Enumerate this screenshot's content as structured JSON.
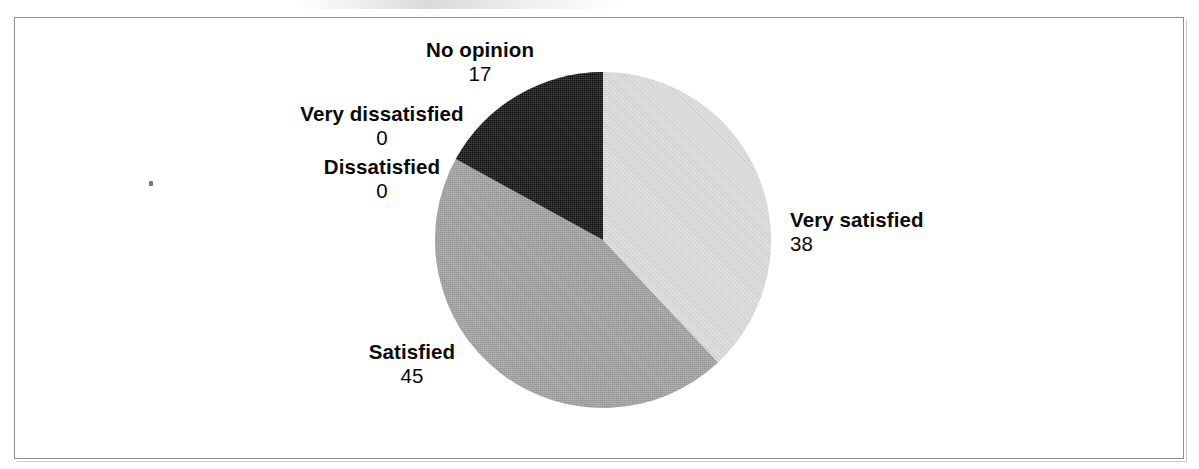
{
  "chart_data": {
    "type": "pie",
    "title": "",
    "categories": [
      "Very satisfied",
      "Satisfied",
      "No opinion",
      "Dissatisfied",
      "Very dissatisfied"
    ],
    "values": [
      38,
      45,
      17,
      0,
      0
    ],
    "total": 100,
    "start_angle_deg": 0,
    "direction": "clockwise",
    "legend": "none",
    "grid": false,
    "slices": [
      {
        "label": "Very satisfied",
        "value": 38,
        "percent": 38,
        "color": "#d8d8d8",
        "start_deg": 0,
        "end_deg": 136.8
      },
      {
        "label": "Satisfied",
        "value": 45,
        "percent": 45,
        "color": "#9a9a9a",
        "start_deg": 136.8,
        "end_deg": 298.8
      },
      {
        "label": "No opinion",
        "value": 17,
        "percent": 17,
        "color": "#0a0a0a",
        "start_deg": 298.8,
        "end_deg": 360
      },
      {
        "label": "Dissatisfied",
        "value": 0,
        "percent": 0,
        "color": "#ffffff",
        "start_deg": 360,
        "end_deg": 360
      },
      {
        "label": "Very dissatisfied",
        "value": 0,
        "percent": 0,
        "color": "#ffffff",
        "start_deg": 360,
        "end_deg": 360
      }
    ]
  },
  "labels": {
    "no_opinion": {
      "name": "No opinion",
      "value": "17"
    },
    "very_dissatisfied": {
      "name": "Very dissatisfied",
      "value": "0"
    },
    "dissatisfied": {
      "name": "Dissatisfied",
      "value": "0"
    },
    "very_satisfied": {
      "name": "Very satisfied",
      "value": "38"
    },
    "satisfied": {
      "name": "Satisfied",
      "value": "45"
    }
  },
  "colors": {
    "very_satisfied": "#d8d8d8",
    "satisfied": "#9a9a9a",
    "no_opinion": "#0a0a0a",
    "frame": "#8d9095",
    "text": "#0a0a0a",
    "background": "#ffffff"
  }
}
